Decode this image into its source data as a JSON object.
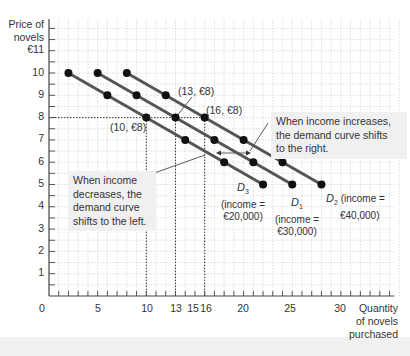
{
  "chart_data": {
    "type": "line",
    "title": "",
    "xlabel": "Quantity of novels purchased",
    "ylabel": "Price of novels",
    "xlim": [
      0,
      36
    ],
    "ylim": [
      0,
      12
    ],
    "grid": true,
    "x_ticks": [
      "0",
      "5",
      "10",
      "13",
      "15",
      "16",
      "20",
      "25",
      "30"
    ],
    "y_ticks": [
      "1",
      "2",
      "3",
      "4",
      "5",
      "6",
      "7",
      "8",
      "9",
      "10",
      "€11"
    ],
    "series": [
      {
        "name": "D3 (income = €20,000)",
        "x": [
          2,
          6,
          10,
          14,
          18,
          22
        ],
        "y": [
          10,
          9,
          8,
          7,
          6,
          5
        ]
      },
      {
        "name": "D1 (income = €30,000)",
        "x": [
          5,
          9,
          13,
          17,
          21,
          25
        ],
        "y": [
          10,
          9,
          8,
          7,
          6,
          5
        ]
      },
      {
        "name": "D2 (income = €40,000)",
        "x": [
          8,
          12,
          16,
          20,
          24,
          28
        ],
        "y": [
          10,
          9,
          8,
          7,
          6,
          5
        ]
      }
    ],
    "annotations": [
      {
        "text": "(10, €8)",
        "x": 10,
        "y": 8
      },
      {
        "text": "(13, €8)",
        "x": 13,
        "y": 8
      },
      {
        "text": "(16, €8)",
        "x": 16,
        "y": 8
      },
      {
        "text": "When income increases, the demand curve shifts to the right."
      },
      {
        "text": "When income decreases, the demand curve shifts to the left."
      }
    ]
  },
  "axes": {
    "y_title_line1": "Price of",
    "y_title_line2": "novels",
    "x_title_line1": "Quantity",
    "x_title_line2": "of novels",
    "x_title_line3": "purchased",
    "y_labels": [
      "1",
      "2",
      "3",
      "4",
      "5",
      "6",
      "7",
      "8",
      "9",
      "10",
      "€11"
    ],
    "x_labels": [
      "0",
      "5",
      "10",
      "13",
      "15",
      "16",
      "20",
      "25",
      "30"
    ]
  },
  "points": {
    "p10": "(10, €8)",
    "p13": "(13, €8)",
    "p16": "(16, €8)"
  },
  "notes": {
    "increase_l1": "When income increases,",
    "increase_l2": "the demand curve shifts",
    "increase_l3": "to the right.",
    "decrease_l1": "When income",
    "decrease_l2": "decreases, the",
    "decrease_l3": "demand curve",
    "decrease_l4": "shifts to the left."
  },
  "curves": {
    "d3_name": "D",
    "d3_sub": "3",
    "d3_income1": "(income =",
    "d3_income2": "€20,000)",
    "d1_name": "D",
    "d1_sub": "1",
    "d1_income1": "(income =",
    "d1_income2": "€30,000)",
    "d2_name": "D",
    "d2_sub": "2",
    "d2_income1": "(income =",
    "d2_income2": "€40,000)"
  },
  "colors": {
    "curve": "#555555",
    "point": "#111111",
    "grid": "#c8c8c8",
    "note_bg": "#f0f0f0"
  }
}
